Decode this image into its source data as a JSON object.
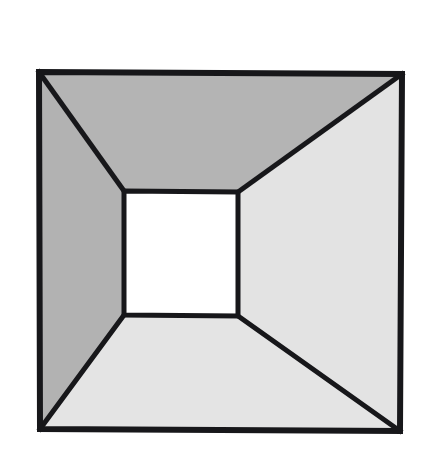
{
  "figure": {
    "name": "corridor-perspective-illusion",
    "title": "Four-face linear perspective box (tunnel / truncated pyramid)",
    "canvas": {
      "width": 428,
      "height": 471,
      "background_color": "#ffffff"
    },
    "geometry": {
      "outer_square": {
        "label": "outer-square",
        "top_left": [
          39,
          72
        ],
        "top_right": [
          402,
          74
        ],
        "bottom_right": [
          400,
          431
        ],
        "bottom_left": [
          40,
          429
        ]
      },
      "inner_square": {
        "label": "inner-square",
        "top_left": [
          124,
          191
        ],
        "top_right": [
          238,
          192
        ],
        "bottom_right": [
          238,
          316
        ],
        "bottom_left": [
          124,
          315
        ]
      },
      "diagonals": [
        {
          "label": "diagonal-top-left",
          "from": [
            39,
            72
          ],
          "to": [
            124,
            191
          ]
        },
        {
          "label": "diagonal-top-right",
          "from": [
            402,
            74
          ],
          "to": [
            238,
            192
          ]
        },
        {
          "label": "diagonal-bottom-right",
          "from": [
            400,
            431
          ],
          "to": [
            238,
            316
          ]
        },
        {
          "label": "diagonal-bottom-left",
          "from": [
            40,
            429
          ],
          "to": [
            124,
            315
          ]
        }
      ]
    },
    "faces": [
      {
        "id": "top-face",
        "label": "Top trapezoid face",
        "fill": "#b4b4b4",
        "points": "39,72 402,74 238,192 124,191"
      },
      {
        "id": "left-face",
        "label": "Left trapezoid face",
        "fill": "#b2b2b2",
        "points": "39,72 124,191 124,315 40,429"
      },
      {
        "id": "right-face",
        "label": "Right trapezoid face",
        "fill": "#e3e3e3",
        "points": "402,74 400,431 238,316 238,192"
      },
      {
        "id": "bottom-face",
        "label": "Bottom trapezoid face",
        "fill": "#e4e4e4",
        "points": "40,429 400,431 238,316 124,315"
      },
      {
        "id": "center-face",
        "label": "Central white square",
        "fill": "#ffffff",
        "points": "124,191 238,192 238,316 124,315"
      }
    ],
    "stroke": {
      "color": "#17171a",
      "outer_width": 6,
      "inner_width": 5,
      "diagonal_width": 5
    }
  }
}
